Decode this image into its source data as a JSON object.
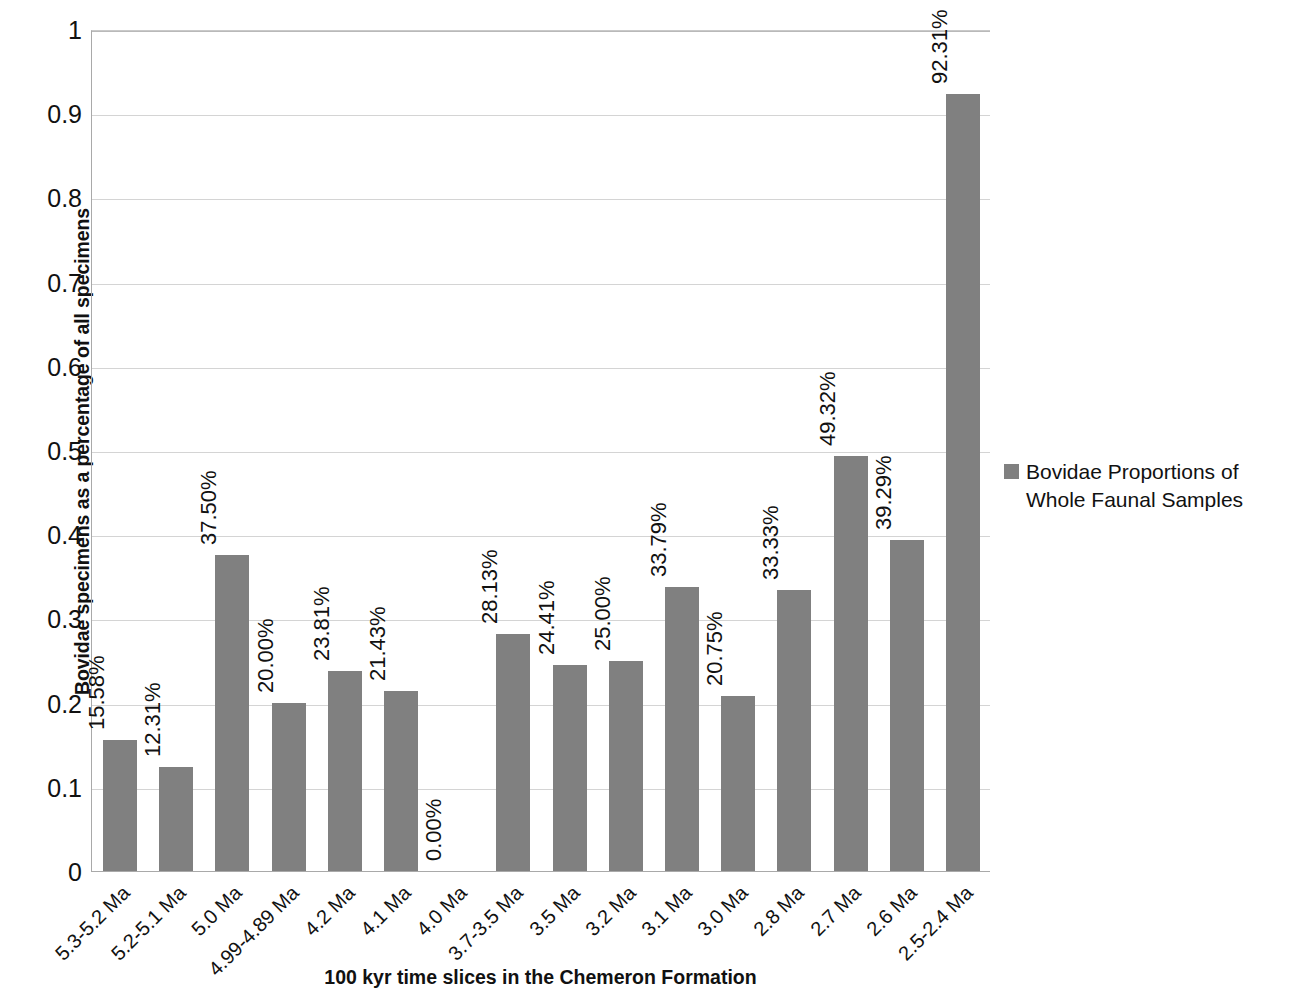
{
  "chart_data": {
    "type": "bar",
    "title": "",
    "xlabel": "100 kyr time slices in the Chemeron Formation",
    "ylabel": "Bovidae specimens as a percentage of all specimens",
    "ylim": [
      0,
      1
    ],
    "y_ticks": [
      "0",
      "0.1",
      "0.2",
      "0.3",
      "0.4",
      "0.5",
      "0.6",
      "0.7",
      "0.8",
      "0.9",
      "1"
    ],
    "y_tick_values": [
      0,
      0.1,
      0.2,
      0.3,
      0.4,
      0.5,
      0.6,
      0.7,
      0.8,
      0.9,
      1
    ],
    "grid": true,
    "legend_position": "right",
    "legend": [
      "Bovidae Proportions of Whole Faunal Samples"
    ],
    "bar_color": "#808080",
    "categories": [
      "5.3-5.2 Ma",
      "5.2-5.1 Ma",
      "5.0 Ma",
      "4.99-4.89 Ma",
      "4.2 Ma",
      "4.1 Ma",
      "4.0 Ma",
      "3.7-3.5 Ma",
      "3.5 Ma",
      "3.2 Ma",
      "3.1 Ma",
      "3.0 Ma",
      "2.8 Ma",
      "2.7 Ma",
      "2.6 Ma",
      "2.5-2.4 Ma"
    ],
    "values": [
      0.1558,
      0.1231,
      0.375,
      0.2,
      0.2381,
      0.2143,
      0.0,
      0.2813,
      0.2441,
      0.25,
      0.3379,
      0.2075,
      0.3333,
      0.4932,
      0.3929,
      0.9231
    ],
    "data_labels": [
      "15.58%",
      "12.31%",
      "37.50%",
      "20.00%",
      "23.81%",
      "21.43%",
      "0.00%",
      "28.13%",
      "24.41%",
      "25.00%",
      "33.79%",
      "20.75%",
      "33.33%",
      "49.32%",
      "39.29%",
      "92.31%"
    ],
    "series": [
      {
        "name": "Bovidae Proportions of Whole Faunal Samples",
        "values": [
          0.1558,
          0.1231,
          0.375,
          0.2,
          0.2381,
          0.2143,
          0.0,
          0.2813,
          0.2441,
          0.25,
          0.3379,
          0.2075,
          0.3333,
          0.4932,
          0.3929,
          0.9231
        ]
      }
    ]
  },
  "legend": {
    "entry_label": "Bovidae Proportions of Whole Faunal Samples"
  },
  "axis": {
    "x_title": "100 kyr time slices in the Chemeron Formation",
    "y_title": "Bovidae specimens as a percentage of all specimens"
  }
}
